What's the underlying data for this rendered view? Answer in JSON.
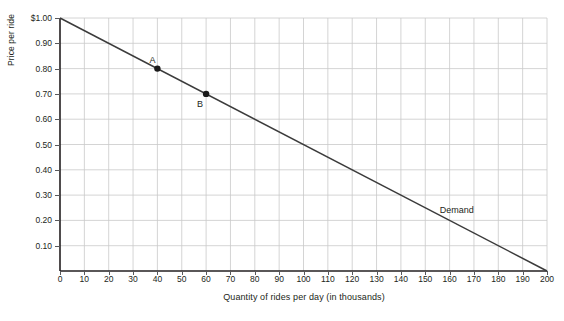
{
  "chart_data": {
    "type": "line",
    "title": "",
    "xlabel": "Quantity of rides per day (in thousands)",
    "ylabel": "Price per ride",
    "xlim": [
      0,
      200
    ],
    "ylim": [
      0,
      1.0
    ],
    "grid": true,
    "legend_position": "inline-annotation",
    "xticks": [
      0,
      10,
      20,
      30,
      40,
      50,
      60,
      70,
      80,
      90,
      100,
      110,
      120,
      130,
      140,
      150,
      160,
      170,
      180,
      190,
      200
    ],
    "xtick_labels": [
      "0",
      "10",
      "20",
      "30",
      "40",
      "50",
      "60",
      "70",
      "80",
      "90",
      "100",
      "110",
      "120",
      "130",
      "140",
      "150",
      "160",
      "170",
      "180",
      "190",
      "200"
    ],
    "yticks": [
      0.1,
      0.2,
      0.3,
      0.4,
      0.5,
      0.6,
      0.7,
      0.8,
      0.9,
      1.0
    ],
    "ytick_labels": [
      "0.10",
      "0.20",
      "0.30",
      "0.40",
      "0.50",
      "0.60",
      "0.70",
      "0.80",
      "0.90",
      "$1.00"
    ],
    "series": [
      {
        "name": "Demand",
        "label": "Demand",
        "label_x": 156,
        "label_y": 0.255,
        "color": "#3b3b3b",
        "x": [
          0,
          200
        ],
        "values": [
          1.0,
          0.0
        ]
      }
    ],
    "points": [
      {
        "label": "A",
        "x": 40,
        "y": 0.8,
        "label_dx": -8,
        "label_dy": -13
      },
      {
        "label": "B",
        "x": 60,
        "y": 0.7,
        "label_dx": -9,
        "label_dy": 6
      }
    ],
    "colors": {
      "line": "#3b3b3b",
      "grid": "#c9c9c9",
      "axis": "#231f20",
      "point": "#1a1a1a",
      "background": "#ffffff",
      "text": "#231f20"
    }
  }
}
